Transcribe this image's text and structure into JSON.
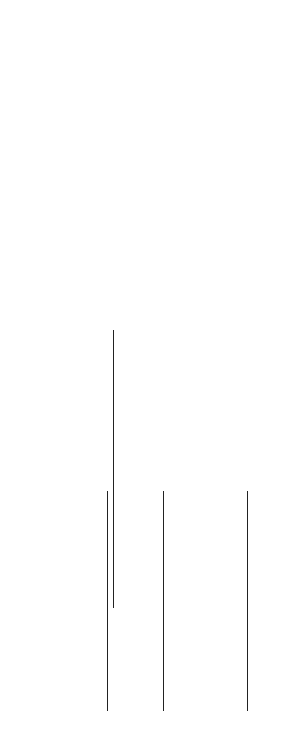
{
  "figure": {
    "caption": "Fig. 8.18b",
    "load_label": "1.0 kip/ft"
  },
  "joints": {
    "A": {
      "label": "A",
      "top": "A'",
      "bottom": "A''"
    },
    "B": {
      "label": "B",
      "top": "B'",
      "bottom": "B''"
    },
    "C": {
      "label": "C",
      "top": "C'",
      "bottom": "C''"
    },
    "D": {
      "label": "D",
      "top": "D'",
      "bottom": "D''"
    },
    "E": {
      "label": "E",
      "top": "E'",
      "bottom": "E''"
    },
    "F": {
      "label": "F",
      "top": "F'",
      "bottom": "F''"
    }
  },
  "tables": {
    "A": {
      "headers": [
        "AA'",
        "AA''",
        "AB"
      ],
      "df": [
        "0.185",
        "0.259",
        "0.556"
      ],
      "rows": [
        [
          "0",
          "0",
          "+13.2"
        ],
        [
          "- 2.4",
          "- 3.4",
          "- 7.3"
        ],
        [
          "0",
          "0",
          "+ 2.2"
        ],
        [
          "- 0.4",
          "- 0.6",
          "- 1.2"
        ]
      ],
      "totals": [
        "- 2.8",
        "- 4.0",
        "+ 6.9"
      ]
    },
    "B": {
      "headers": [
        "BA",
        "BB'",
        "BB''",
        "BC"
      ],
      "df": [
        "0.353",
        "0.177",
        "0.235",
        "0.235"
      ],
      "rows": [
        [
          "0",
          "0",
          "0",
          "-75.0"
        ],
        [
          "+26.4",
          "+13.3",
          "+17.6",
          "+17.6"
        ],
        [
          "- 3.6",
          "0",
          "0",
          "- 8.8"
        ],
        [
          "+ 4.4",
          "+ 2.2",
          "+ 2.9",
          "+ 2.9"
        ]
      ],
      "totals": [
        "+27.2",
        "+15.5",
        "+20.5",
        "-63.3"
      ]
    },
    "C": {
      "headers": [
        "CB",
        "CC'",
        "CC''",
        "CD"
      ],
      "df": [
        "0.210",
        "0.158",
        "0.210",
        "0.421"
      ],
      "rows": [
        [
          "+75.0",
          "0",
          "0",
          "0"
        ],
        [
          "+ 8.8",
          "0",
          "0",
          "0"
        ],
        [
          "- 17.6",
          "-13.2",
          "-17.6",
          "-35.3"
        ],
        [
          "+ 1.5",
          "0",
          "0",
          "+ 3.7"
        ],
        [
          "- 1.1",
          "- 0.8",
          "- 1.1",
          "- 2.2"
        ]
      ],
      "totals": [
        "+66.6",
        "-14.0",
        "-18.7",
        "-33.8"
      ]
    },
    "D": {
      "headers": [
        "DC",
        "DD'",
        "DD''",
        "DE"
      ],
      "df": [
        "0.421",
        "0.158",
        "0.210",
        "0.210"
      ],
      "rows": [
        [
          "-17.6",
          "0",
          "0",
          "0"
        ],
        [
          "+ 7.4",
          "+ 2.8",
          "+ 3.7",
          "+3.7"
        ],
        [
          "- 1.1",
          "0",
          "0",
          "-0.2"
        ],
        [
          "+ 0.5",
          "+ 0.2",
          "+ 0.3",
          "+0.3"
        ]
      ],
      "totals": [
        "-10.8",
        "+ 3.0",
        "+ 4.0",
        "+3.8"
      ]
    },
    "E": {
      "headers": [
        "ED",
        "EE'",
        "EE''",
        "EF"
      ],
      "df": [
        "0.235",
        "0.177",
        "0.235",
        "0.353"
      ],
      "rows": [
        [
          "+1.9",
          "0",
          "0",
          "0"
        ],
        [
          "- 0.4",
          "-0.3",
          "-0.4",
          "-0.7"
        ]
      ],
      "totals": [
        "+1.5",
        "-0.3",
        "-0.4",
        "-0.7"
      ]
    }
  }
}
